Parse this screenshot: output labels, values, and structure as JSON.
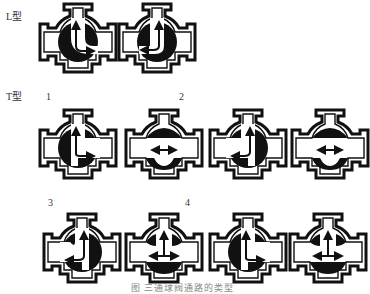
{
  "diagram": {
    "caption": "图 三通球阀通路的类型",
    "sections": [
      {
        "label": "L型",
        "valves": [
          {
            "id": "L-1",
            "type": "L",
            "flow": "left-to-top",
            "ball": "left-open-bottom-solid"
          },
          {
            "id": "L-2",
            "type": "L",
            "flow": "right-to-top",
            "ball": "right-solid"
          }
        ]
      },
      {
        "label": "T型",
        "groups": [
          {
            "number": "1",
            "valves": [
              {
                "id": "T-1a",
                "type": "T",
                "flow": "top-to-right",
                "ball": "left-solid"
              },
              {
                "id": "T-1b",
                "type": "T",
                "flow": "left-right",
                "ball": "top-bottom-solid"
              }
            ]
          },
          {
            "number": "2",
            "valves": [
              {
                "id": "T-2a",
                "type": "T",
                "flow": "top-to-left",
                "ball": "right-solid"
              },
              {
                "id": "T-2b",
                "type": "T",
                "flow": "left-right",
                "ball": "top-bottom-solid"
              }
            ]
          },
          {
            "number": "3",
            "valves": [
              {
                "id": "T-3a",
                "type": "T",
                "flow": "left-to-top",
                "ball": "right-solid"
              },
              {
                "id": "T-3b",
                "type": "T",
                "flow": "top-left-right",
                "ball": "bottom-solid"
              }
            ]
          },
          {
            "number": "4",
            "valves": [
              {
                "id": "T-4a",
                "type": "T",
                "flow": "top-to-right",
                "ball": "left-solid"
              },
              {
                "id": "T-4b",
                "type": "T",
                "flow": "top-left-right",
                "ball": "bottom-solid"
              }
            ]
          }
        ]
      }
    ],
    "colors": {
      "ink": "#111111",
      "background": "#ffffff"
    }
  }
}
